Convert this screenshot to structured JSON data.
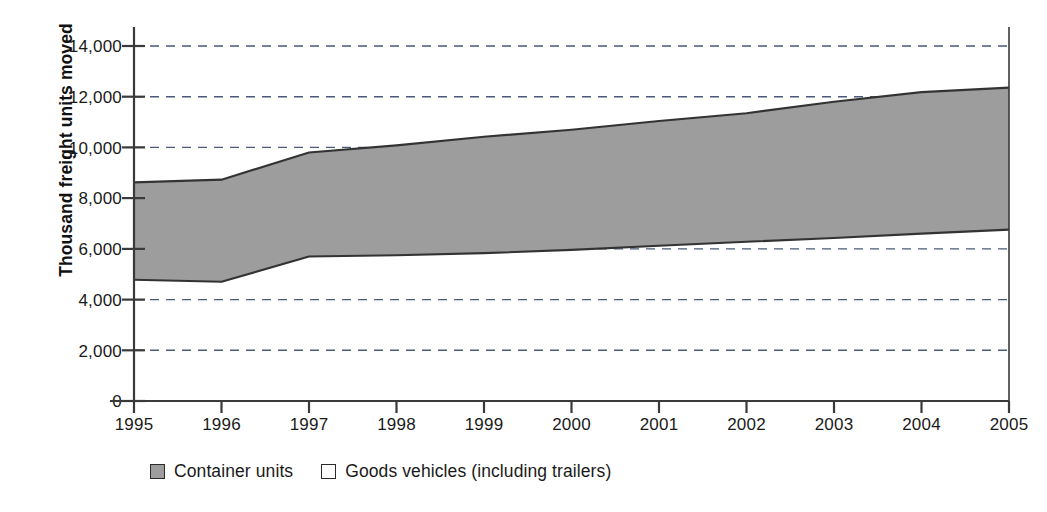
{
  "chart_data": {
    "type": "area",
    "title": "",
    "xlabel": "",
    "ylabel": "Thousand freight units moved",
    "grid": true,
    "legend_position": "bottom-left",
    "x": [
      1995,
      1996,
      1997,
      1998,
      1999,
      2000,
      2001,
      2002,
      2003,
      2004,
      2005
    ],
    "categories": [
      "1995",
      "1996",
      "1997",
      "1998",
      "1999",
      "2000",
      "2001",
      "2002",
      "2003",
      "2004",
      "2005"
    ],
    "xlim": [
      1995,
      2005
    ],
    "ylim": [
      0,
      14000
    ],
    "y_ticks": [
      0,
      2000,
      4000,
      6000,
      8000,
      10000,
      12000,
      14000
    ],
    "y_tick_labels": [
      "0",
      "2,000",
      "4,000",
      "6,000",
      "8,000",
      "10,000",
      "12,000",
      "14,000"
    ],
    "stacking": "cumulative-band",
    "series": [
      {
        "name": "Goods vehicles (including trailers)",
        "role": "lower-boundary",
        "color": "#ffffff",
        "values": [
          4780,
          4700,
          5700,
          5750,
          5830,
          5960,
          6120,
          6280,
          6430,
          6600,
          6760
        ]
      },
      {
        "name": "Container units",
        "role": "upper-boundary",
        "color": "#9d9d9d",
        "values": [
          8620,
          8730,
          9800,
          10080,
          10420,
          10700,
          11040,
          11350,
          11800,
          12180,
          12360
        ]
      }
    ],
    "band_note": "Shaded grey band between the lower Goods vehicles line and the upper Container units line"
  },
  "axes": {
    "y_title": "Thousand freight units moved",
    "y_tick_labels": [
      "14,000",
      "12,000",
      "10,000",
      "8,000",
      "6,000",
      "4,000",
      "2,000",
      "0"
    ],
    "x_tick_labels": [
      "1995",
      "1996",
      "1997",
      "1998",
      "1999",
      "2000",
      "2001",
      "2002",
      "2003",
      "2004",
      "2005"
    ]
  },
  "legend": {
    "items": [
      {
        "label": "Container units",
        "swatch": "filled",
        "color": "#9d9d9d"
      },
      {
        "label": "Goods vehicles (including trailers)",
        "swatch": "empty",
        "color": "#ffffff"
      }
    ]
  },
  "colors": {
    "band_fill": "#9d9d9d",
    "line": "#333333",
    "grid": "#4a5a78",
    "axis": "#3a3a3a",
    "text": "#1a1a1a"
  }
}
